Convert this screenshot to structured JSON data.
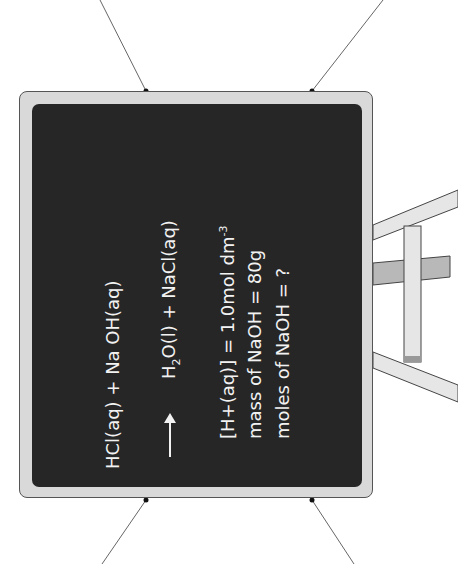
{
  "board": {
    "line1": "HCl(aq) + Na OH(aq)",
    "line2_pre": "H",
    "line2_sub": "2",
    "line2_post": "O(l) + NaCl(aq)",
    "given1_pre": "[H+(aq)] = 1.0mol dm",
    "given1_sup": "-3",
    "given2": "mass of NaOH = 80g",
    "given3": "moles of NaOH = ?"
  },
  "colors": {
    "board": "#262626",
    "frame": "#d9d9d9",
    "text": "#f2f2f2"
  }
}
